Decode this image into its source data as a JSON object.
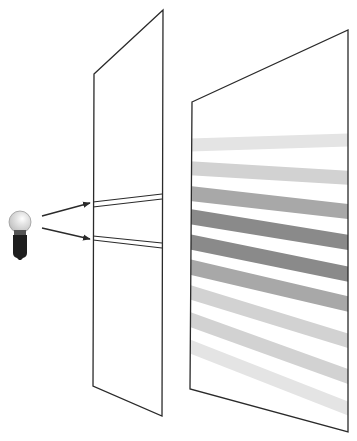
{
  "diagram": {
    "title": "Double-slit diffraction",
    "colors": {
      "line": "#2a2a2a",
      "fringe_dark": "#8a8a8a",
      "fringe_mid": "#a8a8a8",
      "fringe_light": "#d2d2d2",
      "bulb_glass": "#d9d9d9",
      "bulb_base": "#1e1e1e"
    },
    "light_source": {
      "type": "light-bulb",
      "cx": 20,
      "cy": 222,
      "r": 11
    },
    "rays": [
      {
        "x1": 42,
        "y1": 216,
        "x2": 90,
        "y2": 203
      },
      {
        "x1": 42,
        "y1": 228,
        "x2": 90,
        "y2": 239
      }
    ],
    "slit_panel": {
      "points": "94,74 163,10 162,416 93,386",
      "slits": [
        {
          "top": [
            93,
            202,
            162,
            194
          ],
          "bottom": [
            93,
            207,
            162,
            199
          ]
        },
        {
          "top": [
            93,
            236,
            162,
            243
          ],
          "bottom": [
            93,
            240,
            162,
            248
          ]
        }
      ]
    },
    "screen_panel": {
      "points": "192,102 348,30 348,432 190,389",
      "fringes": [
        {
          "y_left": 145,
          "y_right": 140,
          "shade": "faint"
        },
        {
          "y_left": 168,
          "y_right": 178,
          "shade": "light"
        },
        {
          "y_left": 193,
          "y_right": 212,
          "shade": "mid"
        },
        {
          "y_left": 216,
          "y_right": 243,
          "shade": "dark"
        },
        {
          "y_left": 241,
          "y_right": 275,
          "shade": "dark"
        },
        {
          "y_left": 266,
          "y_right": 305,
          "shade": "mid"
        },
        {
          "y_left": 291,
          "y_right": 342,
          "shade": "light"
        },
        {
          "y_left": 318,
          "y_right": 378,
          "shade": "light"
        },
        {
          "y_left": 345,
          "y_right": 410,
          "shade": "faint"
        }
      ]
    }
  }
}
